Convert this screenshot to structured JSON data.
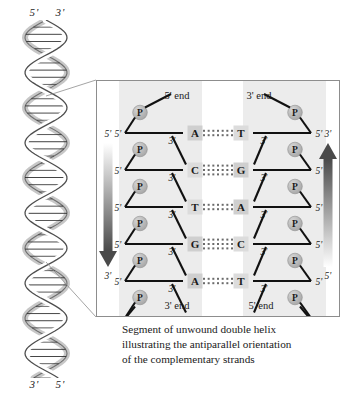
{
  "helix": {
    "top_labels": [
      "5'",
      "3'"
    ],
    "bottom_labels": [
      "3'",
      "5'"
    ]
  },
  "panel": {
    "ends": {
      "top_left": "5' end",
      "top_right": "3' end",
      "bottom_left": "3' end",
      "bottom_right": "5' end"
    },
    "left_arrow": {
      "top": "5'",
      "bottom": "3'"
    },
    "right_arrow": {
      "top": "3'",
      "bottom": "5'"
    },
    "phosphate_label": "P",
    "sugar_labels": {
      "five_prime": "5'",
      "three_prime": "3'"
    },
    "base_pairs": [
      {
        "left": "A",
        "right": "T",
        "bonds": 2
      },
      {
        "left": "C",
        "right": "G",
        "bonds": 3
      },
      {
        "left": "T",
        "right": "A",
        "bonds": 2
      },
      {
        "left": "G",
        "right": "C",
        "bonds": 3
      },
      {
        "left": "A",
        "right": "T",
        "bonds": 2
      }
    ]
  },
  "caption": {
    "line1": "Segment of unwound double helix",
    "line2": "illustrating the antiparallel orientation",
    "line3": "of the complementary strands"
  },
  "colors": {
    "background": "#ffffff",
    "band_shade": "#ececec",
    "panel_border": "#8d8d8d",
    "backbone": "#111111",
    "phosphate_fill": "#b3b3b3",
    "base_box_purine": "#cfcfcf",
    "base_box_pyrimidine": "#dcdcdc",
    "arrow_dark": "#4a4a4a",
    "text": "#1a1a1a"
  }
}
